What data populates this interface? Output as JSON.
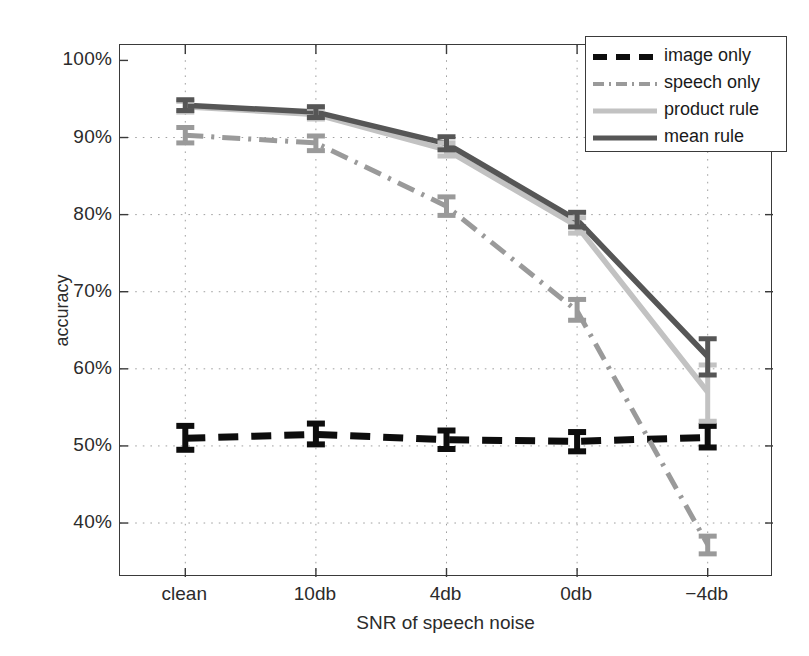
{
  "chart_data": {
    "type": "line",
    "title": "",
    "xlabel": "SNR of speech noise",
    "ylabel": "accuracy",
    "categories": [
      "clean",
      "10db",
      "4db",
      "0db",
      "-4db"
    ],
    "ytick_labels": [
      "100%",
      "90%",
      "80%",
      "70%",
      "60%",
      "50%",
      "40%"
    ],
    "ytick_values": [
      100,
      90,
      80,
      70,
      60,
      50,
      40
    ],
    "ylim": [
      33,
      102
    ],
    "grid": true,
    "legend_position": "top-right",
    "series": [
      {
        "name": "image only",
        "color": "#0d0d0d",
        "style": "dashed",
        "values": [
          51.0,
          51.5,
          50.8,
          50.6,
          51.1
        ],
        "err_low": [
          49.5,
          50.2,
          49.6,
          49.3,
          49.8
        ],
        "err_high": [
          52.6,
          52.9,
          52.0,
          51.8,
          52.6
        ]
      },
      {
        "name": "speech only",
        "color": "#9a9a9a",
        "style": "dash-dot",
        "values": [
          90.3,
          89.3,
          81.1,
          67.5,
          37.2
        ],
        "err_low": [
          89.3,
          88.3,
          79.9,
          66.3,
          36.0
        ],
        "err_high": [
          91.3,
          90.2,
          82.3,
          69.0,
          38.3
        ]
      },
      {
        "name": "product rule",
        "color": "#c2c2c2",
        "style": "solid",
        "values": [
          94.0,
          93.0,
          88.4,
          78.5,
          57.0
        ],
        "err_low": [
          93.3,
          92.4,
          87.6,
          77.6,
          53.2
        ],
        "err_high": [
          94.7,
          93.8,
          89.3,
          79.6,
          60.5
        ]
      },
      {
        "name": "mean rule",
        "color": "#565656",
        "style": "solid",
        "values": [
          94.2,
          93.3,
          89.2,
          79.3,
          61.6
        ],
        "err_low": [
          93.5,
          92.6,
          88.4,
          78.4,
          59.2
        ],
        "err_high": [
          94.9,
          94.0,
          90.1,
          80.3,
          63.9
        ]
      }
    ]
  },
  "legend": {
    "items": [
      {
        "label": "image only"
      },
      {
        "label": "speech only"
      },
      {
        "label": "product rule"
      },
      {
        "label": "mean rule"
      }
    ]
  }
}
